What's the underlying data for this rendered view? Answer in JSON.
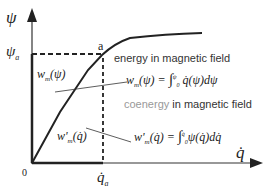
{
  "diagram": {
    "axes": {
      "y_label": "ψ",
      "x_label": "q̇",
      "origin_label": "0",
      "y_tick_label": "ψa",
      "x_tick_label": "q̇a"
    },
    "point_label": "a",
    "energy_caption": "energy  in magnetic field",
    "coenergy_caption_word": "coenergy",
    "coenergy_caption_rest": " in magnetic field",
    "energy_region_label": "wm(ψ)",
    "energy_formula": "wm(ψ) = ∫₀^ψ q̇(ψ) dψ",
    "coenergy_region_label": "w'm(q̇)",
    "coenergy_formula": "w'm(q̇) = ∫₀^q̇ ψ(q̇) dq̇",
    "colors": {
      "line": "#222222",
      "caption": "#333333",
      "coenergy_word": "#999999"
    }
  }
}
